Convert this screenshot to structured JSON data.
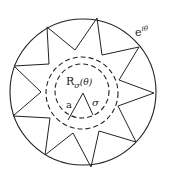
{
  "diagram": {
    "labels": {
      "boundary": {
        "base": "e",
        "exponent": "iθ"
      },
      "region": {
        "base": "R",
        "subscript": "σ",
        "arg": "(θ)"
      },
      "a": "a",
      "sigma": "σ"
    },
    "colors": {
      "stroke": "#222222",
      "background": "#ffffff"
    },
    "outer_circle": {
      "cx": 83,
      "cy": 92,
      "r": 73
    },
    "star_polygon": [
      [
        97,
        18
      ],
      [
        75,
        50
      ],
      [
        47,
        27
      ],
      [
        49,
        64
      ],
      [
        14,
        66
      ],
      [
        41,
        92
      ],
      [
        13,
        116
      ],
      [
        50,
        118
      ],
      [
        45,
        155
      ],
      [
        73,
        133
      ],
      [
        91,
        167
      ],
      [
        99,
        131
      ],
      [
        136,
        142
      ],
      [
        118,
        106
      ],
      [
        154,
        93
      ],
      [
        119,
        80
      ],
      [
        139,
        47
      ],
      [
        102,
        55
      ]
    ],
    "center_spike": [
      [
        68,
        120
      ],
      [
        83,
        93
      ],
      [
        93,
        115
      ]
    ],
    "dashed_circles": [
      {
        "cx": 82,
        "cy": 93,
        "r": 36
      },
      {
        "cx": 82,
        "cy": 91,
        "r": 27
      }
    ]
  }
}
